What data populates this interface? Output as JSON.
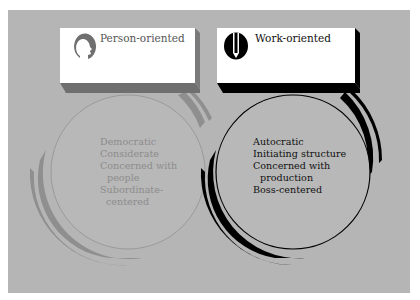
{
  "colors": {
    "background": "#b5b5b5",
    "person_accent": "#8f8f8f",
    "person_text": "#8c8c8c",
    "work_accent": "#000000",
    "work_text": "#111111",
    "card": "#ffffff"
  },
  "person": {
    "label": "Person-oriented",
    "icon": "head-profile-icon",
    "items": [
      "Democratic",
      "Considerate",
      "Concerned with",
      "people",
      "Subordinate-",
      "centered"
    ]
  },
  "work": {
    "label": "Work-oriented",
    "icon": "pencil-icon",
    "items": [
      "Autocratic",
      "Initiating structure",
      "Concerned with",
      "production",
      "Boss-centered"
    ]
  }
}
